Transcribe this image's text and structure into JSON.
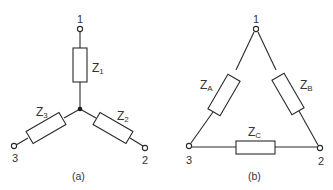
{
  "figure": {
    "star": {
      "caption": "(a)",
      "terminals": [
        "1",
        "2",
        "3"
      ],
      "impedances": [
        {
          "symbol": "Z",
          "sub": "1"
        },
        {
          "symbol": "Z",
          "sub": "2"
        },
        {
          "symbol": "Z",
          "sub": "3"
        }
      ]
    },
    "delta": {
      "caption": "(b)",
      "terminals": [
        "1",
        "2",
        "3"
      ],
      "impedances": [
        {
          "symbol": "Z",
          "sub": "A"
        },
        {
          "symbol": "Z",
          "sub": "B"
        },
        {
          "symbol": "Z",
          "sub": "C"
        }
      ]
    },
    "colors": {
      "line": "#2a2a2a",
      "text": "#333333",
      "background": "#ffffff"
    }
  }
}
